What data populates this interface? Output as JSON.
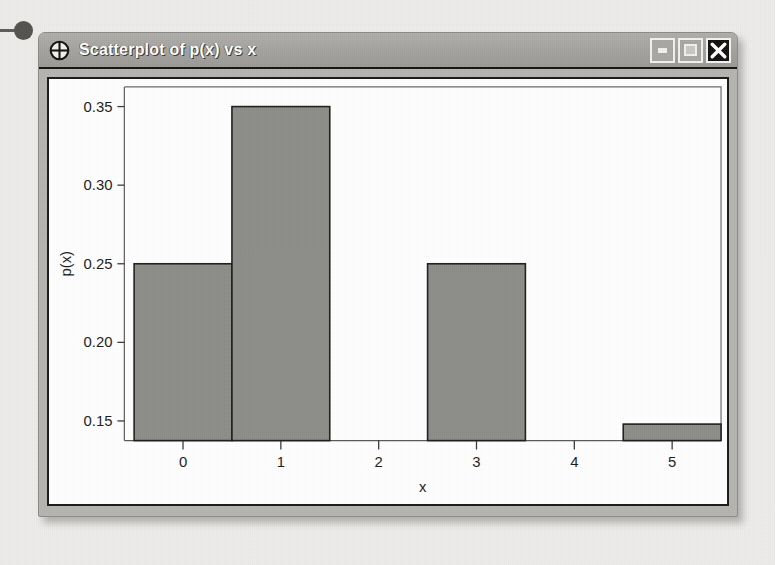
{
  "window": {
    "title": "Scatterplot of p(x) vs x",
    "app_icon": "crosshair-target-icon",
    "controls": {
      "minimize_label": "",
      "maximize_label": "",
      "close_label": ""
    }
  },
  "chart_data": {
    "type": "bar",
    "title": "",
    "xlabel": "x",
    "ylabel": "p(x)",
    "categories": [
      "0",
      "1",
      "2",
      "3",
      "4",
      "5"
    ],
    "x": [
      0,
      1,
      2,
      3,
      4,
      5
    ],
    "values": [
      0.25,
      0.35,
      0.0,
      0.25,
      0.0,
      0.148
    ],
    "xtick_labels": [
      "0",
      "1",
      "2",
      "3",
      "4",
      "5"
    ],
    "ytick_labels": [
      "0.15",
      "0.20",
      "0.25",
      "0.30",
      "0.35"
    ],
    "ytick_values": [
      0.15,
      0.2,
      0.25,
      0.3,
      0.35
    ],
    "xlim": [
      -0.6,
      5.5
    ],
    "ylim": [
      0.1375,
      0.3625
    ],
    "grid": false,
    "legend": false,
    "bar_width": 1.0,
    "bar_fill_color": "#8d8d8a",
    "bar_edge_color": "#1e1e1c",
    "plot_background": "#ffffff"
  }
}
